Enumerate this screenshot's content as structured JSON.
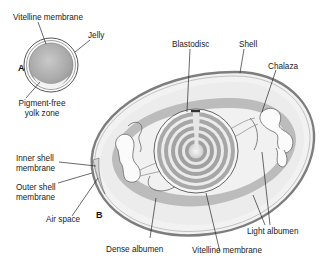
{
  "figure": {
    "panels": [
      {
        "id": "A",
        "label": "A"
      },
      {
        "id": "B",
        "label": "B"
      }
    ],
    "panel_a_labels": {
      "vitelline_membrane": "Vitelline membrane",
      "jelly": "Jelly",
      "pigment_free_line1": "Pigment-free",
      "pigment_free_line2": "yolk zone"
    },
    "panel_b_labels": {
      "blastodisc": "Blastodisc",
      "shell": "Shell",
      "chalaza": "Chalaza",
      "inner_shell_line1": "Inner shell",
      "inner_shell_line2": "membrane",
      "outer_shell_line1": "Outer shell",
      "outer_shell_line2": "membrane",
      "air_space": "Air space",
      "dense_albumen": "Dense albumen",
      "vitelline_membrane": "Vitelline membrane",
      "light_albumen": "Light albumen"
    },
    "colors": {
      "line": "#3a3a3a",
      "shell": "#8a8a8a",
      "dense_albumen": "#b9b9b9",
      "light_albumen": "#ededed",
      "yolk_ring_dark": "#9c9c9c",
      "yolk_ring_light": "#f4f4f4"
    }
  }
}
